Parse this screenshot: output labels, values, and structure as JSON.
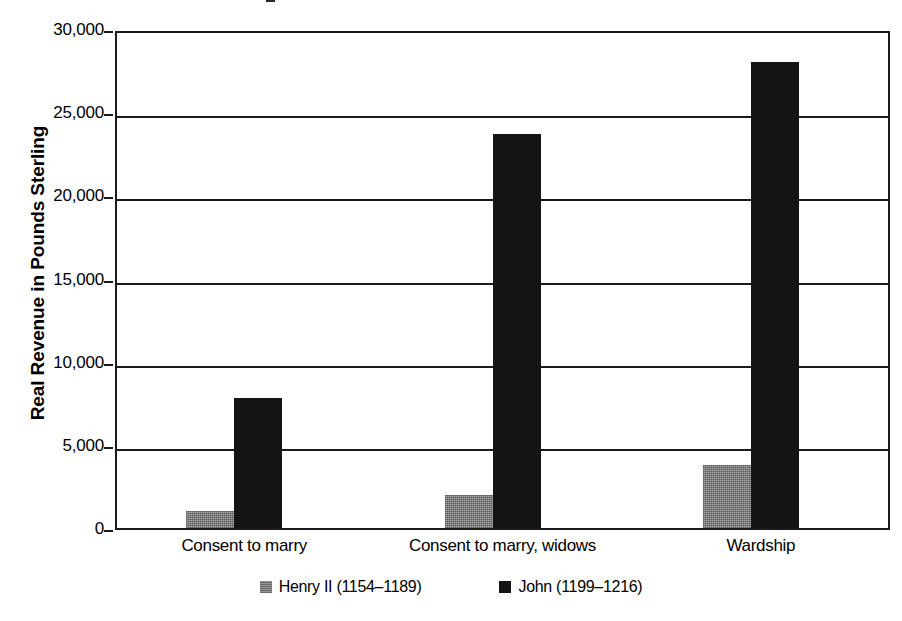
{
  "chart_data": {
    "type": "bar",
    "title": "",
    "xlabel": "",
    "ylabel": "Real Revenue in Pounds Sterling",
    "categories": [
      "Consent to marry",
      "Consent to marry, widows",
      "Wardship"
    ],
    "series": [
      {
        "name": "Henry II (1154–1189)",
        "color": "#808080",
        "values": [
          1000,
          2000,
          3800
        ]
      },
      {
        "name": "John (1199–1216)",
        "color": "#141414",
        "values": [
          7800,
          23700,
          28000
        ]
      }
    ],
    "ylim": [
      0,
      30000
    ],
    "yticks": [
      0,
      5000,
      10000,
      15000,
      20000,
      25000,
      30000
    ],
    "ytick_labels": [
      "0",
      "5,000",
      "10,000",
      "15,000",
      "20,000",
      "25,000",
      "30,000"
    ],
    "grid": true,
    "grid_axis": "y",
    "legend_position": "bottom"
  },
  "axis": {
    "y_title": "Real Revenue in Pounds Sterling"
  },
  "legend": {
    "items": [
      {
        "label": "Henry II (1154–1189)",
        "swatch": "henry"
      },
      {
        "label": "John (1199–1216)",
        "swatch": "john"
      }
    ]
  }
}
